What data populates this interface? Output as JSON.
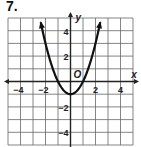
{
  "problem": {
    "number": "7."
  },
  "chart_data": {
    "type": "line",
    "title": "",
    "function": "y = x^2 - 1",
    "xlabel": "x",
    "ylabel": "y",
    "origin_label": "O",
    "xlim": [
      -5,
      5
    ],
    "ylim": [
      -5,
      5
    ],
    "grid": true,
    "x_tick_labels": [
      "-4",
      "-2",
      "2",
      "4"
    ],
    "y_tick_labels": [
      "4",
      "2",
      "-2",
      "-4"
    ],
    "vertex": [
      0,
      -1
    ],
    "x": [
      -2.4,
      -2,
      -1.5,
      -1,
      -0.5,
      0,
      0.5,
      1,
      1.5,
      2,
      2.4
    ],
    "values": [
      4.76,
      3,
      1.25,
      0,
      -0.75,
      -1,
      -0.75,
      0,
      1.25,
      3,
      4.76
    ],
    "colors": {
      "curve": "#111111",
      "grid": "#555555",
      "axis": "#222222"
    }
  }
}
